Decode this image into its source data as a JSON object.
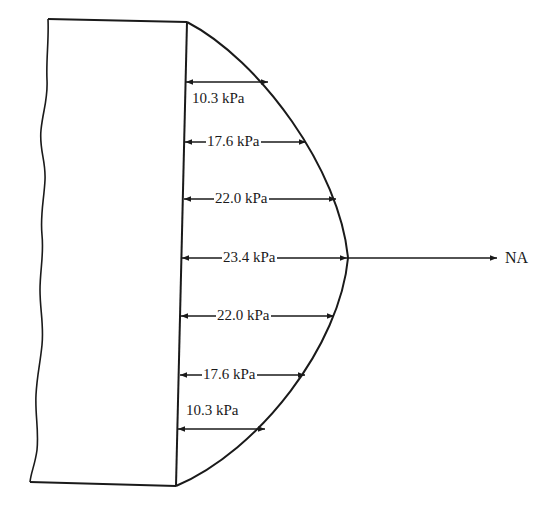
{
  "diagram": {
    "neutral_axis_label": "NA",
    "unit": "kPa",
    "stress_levels": [
      {
        "position": "top-1",
        "label": "10.3 kPa",
        "value": 10.3
      },
      {
        "position": "top-2",
        "label": "17.6 kPa",
        "value": 17.6
      },
      {
        "position": "top-3",
        "label": "22.0 kPa",
        "value": 22.0
      },
      {
        "position": "neutral-axis",
        "label": "23.4 kPa",
        "value": 23.4
      },
      {
        "position": "bottom-3",
        "label": "22.0 kPa",
        "value": 22.0
      },
      {
        "position": "bottom-2",
        "label": "17.6 kPa",
        "value": 17.6
      },
      {
        "position": "bottom-1",
        "label": "10.3 kPa",
        "value": 10.3
      }
    ],
    "colors": {
      "line": "#1a1a1a",
      "background": "#ffffff"
    }
  }
}
